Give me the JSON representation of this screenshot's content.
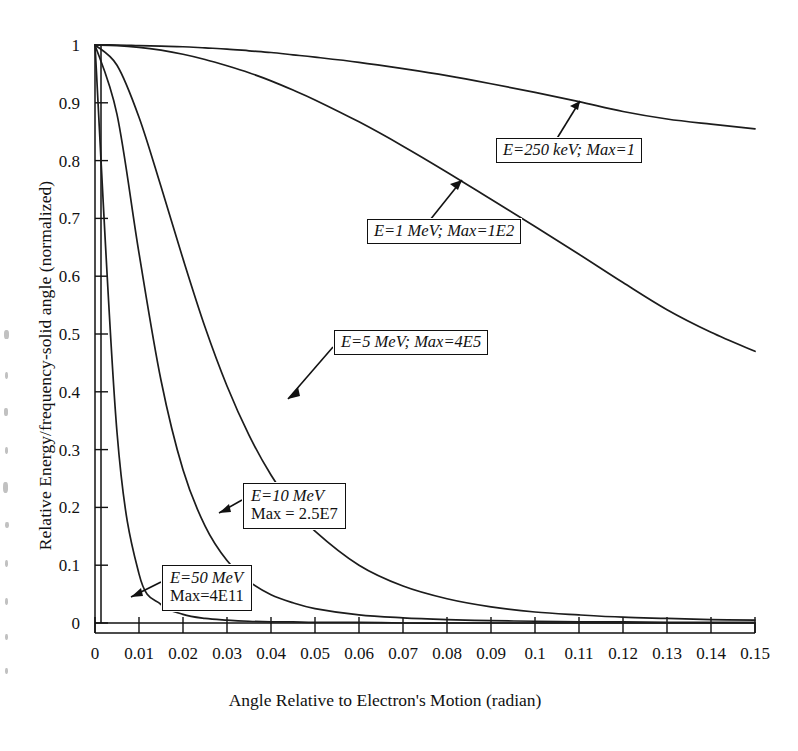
{
  "chart_data": {
    "type": "line",
    "title": "",
    "xlabel": "Angle Relative to Electron's Motion (radian)",
    "ylabel": "Relative Energy/frequency-solid angle (normalized)",
    "xlim": [
      0,
      0.15
    ],
    "ylim": [
      0,
      1
    ],
    "grid": false,
    "legend": "annotated-callouts",
    "xticks": [
      "0",
      "0.01",
      "0.02",
      "0.03",
      "0.04",
      "0.05",
      "0.06",
      "0.07",
      "0.08",
      "0.09",
      "0.1",
      "0.11",
      "0.12",
      "0.13",
      "0.14",
      "0.15"
    ],
    "xtick_values": [
      0,
      0.01,
      0.02,
      0.03,
      0.04,
      0.05,
      0.06,
      0.07,
      0.08,
      0.09,
      0.1,
      0.11,
      0.12,
      0.13,
      0.14,
      0.15
    ],
    "yticks": [
      "0",
      "0.1",
      "0.2",
      "0.3",
      "0.4",
      "0.5",
      "0.6",
      "0.7",
      "0.8",
      "0.9",
      "1"
    ],
    "ytick_values": [
      0,
      0.1,
      0.2,
      0.3,
      0.4,
      0.5,
      0.6,
      0.7,
      0.8,
      0.9,
      1
    ],
    "x": [
      0,
      0.005,
      0.01,
      0.015,
      0.02,
      0.025,
      0.03,
      0.035,
      0.04,
      0.045,
      0.05,
      0.06,
      0.07,
      0.08,
      0.09,
      0.1,
      0.11,
      0.12,
      0.13,
      0.14,
      0.15
    ],
    "series": [
      {
        "name": "E=250 keV",
        "label": "E=250 keV; Max=1",
        "max": "1",
        "values": [
          1,
          1,
          0.999,
          0.998,
          0.997,
          0.995,
          0.993,
          0.99,
          0.987,
          0.983,
          0.979,
          0.97,
          0.959,
          0.947,
          0.933,
          0.918,
          0.902,
          0.885,
          0.872,
          0.863,
          0.855
        ]
      },
      {
        "name": "E=1 MeV",
        "label": "E=1 MeV; Max=1E2",
        "max": "1E2",
        "values": [
          1,
          0.999,
          0.996,
          0.991,
          0.984,
          0.975,
          0.964,
          0.952,
          0.938,
          0.922,
          0.905,
          0.867,
          0.825,
          0.78,
          0.733,
          0.686,
          0.638,
          0.589,
          0.542,
          0.503,
          0.47
        ]
      },
      {
        "name": "E=5 MeV",
        "label": "E=5 MeV; Max=4E5",
        "max": "4E5",
        "values": [
          1,
          0.965,
          0.875,
          0.755,
          0.63,
          0.512,
          0.41,
          0.325,
          0.256,
          0.202,
          0.159,
          0.1,
          0.064,
          0.042,
          0.028,
          0.019,
          0.014,
          0.01,
          0.008,
          0.006,
          0.005
        ]
      },
      {
        "name": "E=10 MeV",
        "label": "E=10 MeV Max = 2.5E7",
        "label_line1": "E=10 MeV",
        "label_line2": "Max = 2.5E7",
        "max": "2.5E7",
        "values": [
          1,
          0.88,
          0.64,
          0.42,
          0.265,
          0.168,
          0.108,
          0.072,
          0.049,
          0.035,
          0.025,
          0.014,
          0.009,
          0.006,
          0.004,
          0.003,
          0.002,
          0.002,
          0.001,
          0.001,
          0.001
        ]
      },
      {
        "name": "E=50 MeV",
        "label": "E=50 MeV Max=4E11",
        "label_line1": "E=50 MeV",
        "label_line2": "Max=4E11",
        "max": "4E11",
        "values": [
          1,
          0.33,
          0.085,
          0.032,
          0.015,
          0.008,
          0.005,
          0.003,
          0.002,
          0.002,
          0.001,
          0.001,
          0,
          0,
          0,
          0,
          0,
          0,
          0,
          0,
          0
        ]
      }
    ],
    "annotations": [
      {
        "id": "a250kev",
        "text": "E=250 keV; Max=1",
        "points_to": "250 keV curve"
      },
      {
        "id": "a1mev",
        "text": "E=1 MeV; Max=1E2",
        "points_to": "1 MeV curve"
      },
      {
        "id": "a5mev",
        "text": "E=5 MeV; Max=4E5",
        "points_to": "5 MeV curve"
      },
      {
        "id": "a10mev",
        "line1": "E=10 MeV",
        "line2": "Max = 2.5E7",
        "points_to": "10 MeV curve"
      },
      {
        "id": "a50mev",
        "line1": "E=50 MeV",
        "line2": "Max=4E11",
        "points_to": "50 MeV curve"
      }
    ],
    "colors": {
      "curve": "#1c1c1c",
      "axis": "#111111",
      "background": "#ffffff"
    }
  }
}
